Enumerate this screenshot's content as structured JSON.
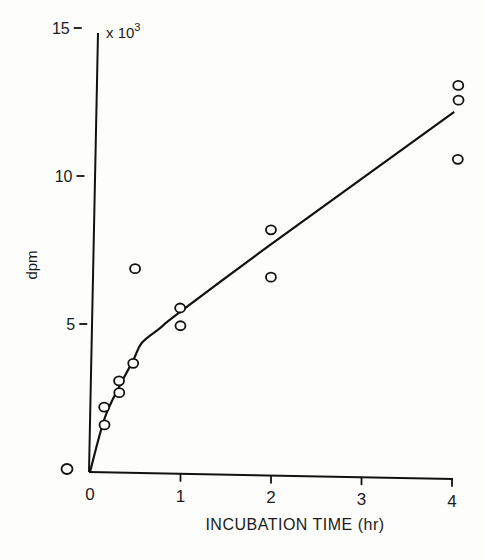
{
  "chart_data": {
    "type": "scatter",
    "title": "",
    "xlabel": "INCUBATION TIME (hr)",
    "ylabel": "dpm",
    "y_multiplier_label": "x 10",
    "y_multiplier_exp": "3",
    "xlim": [
      0,
      4
    ],
    "ylim": [
      0,
      15
    ],
    "x_ticks": [
      "0",
      "1",
      "2",
      "3",
      "4"
    ],
    "y_ticks": [
      "0",
      "5",
      "10",
      "15"
    ],
    "grid": false,
    "legend": null,
    "series": [
      {
        "name": "observed",
        "marker": "open-circle",
        "points": [
          {
            "x": 0.17,
            "y": 2.2
          },
          {
            "x": 0.17,
            "y": 1.6
          },
          {
            "x": 0.34,
            "y": 3.1
          },
          {
            "x": 0.34,
            "y": 2.7
          },
          {
            "x": 0.5,
            "y": 3.7
          },
          {
            "x": 0.54,
            "y": 6.9
          },
          {
            "x": 1.03,
            "y": 5.6
          },
          {
            "x": 1.03,
            "y": 5.0
          },
          {
            "x": 2.05,
            "y": 8.3
          },
          {
            "x": 2.04,
            "y": 6.7
          },
          {
            "x": 4.15,
            "y": 13.3
          },
          {
            "x": 4.15,
            "y": 12.8
          },
          {
            "x": 4.13,
            "y": 10.8
          }
        ]
      },
      {
        "name": "fitted curve",
        "type": "line",
        "points": [
          {
            "x": 0,
            "y": 0
          },
          {
            "x": 0.17,
            "y": 1.8
          },
          {
            "x": 0.34,
            "y": 2.9
          },
          {
            "x": 0.5,
            "y": 3.8
          },
          {
            "x": 0.6,
            "y": 4.4
          },
          {
            "x": 0.8,
            "y": 4.9
          },
          {
            "x": 1.0,
            "y": 5.4
          },
          {
            "x": 2.0,
            "y": 7.7
          },
          {
            "x": 4.1,
            "y": 12.4
          }
        ]
      }
    ]
  }
}
